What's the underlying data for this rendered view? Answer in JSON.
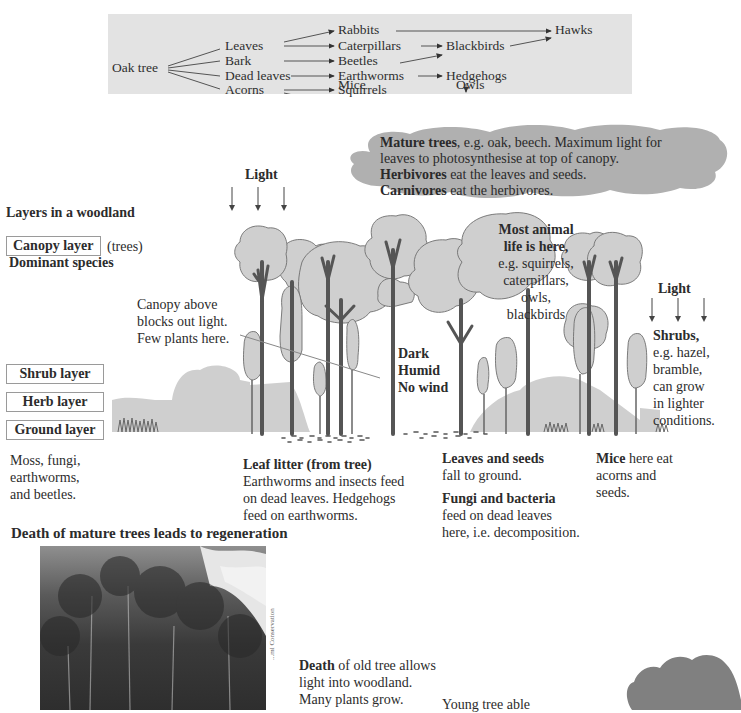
{
  "food_web": {
    "producer": "Oak tree",
    "parts": [
      "Leaves",
      "Bark",
      "Dead leaves",
      "Acorns"
    ],
    "primary_consumers": [
      "Rabbits",
      "Caterpillars",
      "Beetles",
      "Earthworms",
      "Squirrels",
      "Mice"
    ],
    "secondary_consumers": [
      "Blackbirds",
      "Hedgehogs",
      "Owls"
    ],
    "top_consumer": "Hawks",
    "links": [
      [
        "Oak tree",
        "Leaves"
      ],
      [
        "Oak tree",
        "Bark"
      ],
      [
        "Oak tree",
        "Dead leaves"
      ],
      [
        "Oak tree",
        "Acorns"
      ],
      [
        "Leaves",
        "Rabbits"
      ],
      [
        "Leaves",
        "Caterpillars"
      ],
      [
        "Bark",
        "Beetles"
      ],
      [
        "Dead leaves",
        "Earthworms"
      ],
      [
        "Acorns",
        "Squirrels"
      ],
      [
        "Acorns",
        "Mice"
      ],
      [
        "Rabbits",
        "Hawks"
      ],
      [
        "Caterpillars",
        "Blackbirds"
      ],
      [
        "Beetles",
        "Blackbirds"
      ],
      [
        "Blackbirds",
        "Hawks"
      ],
      [
        "Earthworms",
        "Hedgehogs"
      ],
      [
        "Hedgehogs",
        "Owls"
      ],
      [
        "Squirrels",
        "Owls"
      ],
      [
        "Mice",
        "Owls"
      ]
    ]
  },
  "canopy_cloud": {
    "line1_bold": "Mature trees",
    "line1_rest": ", e.g. oak, beech.  Maximum light for",
    "line2": "leaves to photosynthesise at top of canopy.",
    "line3_bold": "Herbivores",
    "line3_rest": " eat the leaves and seeds.",
    "line4_bold": "Carnivores",
    "line4_rest": " eat the herbivores."
  },
  "light_top": "Light",
  "light_right": "Light",
  "section_title": "Layers in a woodland",
  "layers": {
    "canopy": "Canopy layer",
    "canopy_note": "(trees)",
    "canopy_sub": "Dominant species",
    "shrub": "Shrub layer",
    "herb": "Herb layer",
    "ground": "Ground layer",
    "ground_note": [
      "Moss, fungi,",
      "earthworms,",
      "and beetles."
    ]
  },
  "canopy_above": [
    "Canopy above",
    "blocks out light.",
    "Few plants here."
  ],
  "animal_life": {
    "bold1": "Most animal",
    "bold2": "life is here,",
    "lines": [
      "e.g. squirrels,",
      "caterpillars,",
      "owls,",
      "blackbirds"
    ]
  },
  "conditions": [
    "Dark",
    "Humid",
    "No wind"
  ],
  "shrubs_note": {
    "bold": "Shrubs,",
    "lines": [
      "e.g. hazel,",
      "bramble,",
      "can grow",
      "in lighter",
      "conditions."
    ]
  },
  "leaf_litter": {
    "bold": "Leaf litter (from tree)",
    "lines": [
      "Earthworms and insects feed",
      "on dead leaves. Hedgehogs",
      "feed on earthworms."
    ]
  },
  "leaves_seeds": {
    "bold": "Leaves and seeds",
    "line": "fall to ground."
  },
  "fungi": {
    "bold": "Fungi and bacteria",
    "lines": [
      "feed on dead leaves",
      "here, i.e. decomposition."
    ]
  },
  "mice": {
    "bold": "Mice",
    "line1_rest": " here eat",
    "lines": [
      "acorns and",
      "seeds."
    ]
  },
  "regeneration_title": "Death of mature trees leads to regeneration",
  "photo_credit": "...ml Conservation",
  "death_note": {
    "bold": "Death",
    "line1_rest": " of old tree allows",
    "lines": [
      "light into woodland.",
      "Many plants grow."
    ]
  },
  "young_tree": "Young tree able",
  "colors": {
    "panel_bg": "#e3e3e3",
    "cloud": "#b0b0b0",
    "foliage": "#cfcfcf",
    "trunk": "#555555",
    "dark_cloud": "#808080"
  }
}
